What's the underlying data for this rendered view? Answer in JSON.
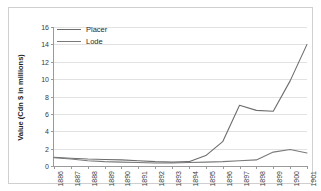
{
  "chart_data": {
    "type": "line",
    "title": "",
    "xlabel": "",
    "ylabel": "Value (Cdn $ in millions)",
    "ylim": [
      0,
      16
    ],
    "ytick_labels": [
      "0",
      "2",
      "4",
      "6",
      "8",
      "10",
      "12",
      "14",
      "16"
    ],
    "ytick_values": [
      0,
      2,
      4,
      6,
      8,
      10,
      12,
      14,
      16
    ],
    "grid": true,
    "legend_position": "top-left",
    "categories": [
      "1886",
      "1887",
      "1888",
      "1889",
      "1890",
      "1891",
      "1892",
      "1893",
      "1894",
      "1895",
      "1896",
      "1897",
      "1898",
      "1899",
      "1900",
      "1901"
    ],
    "series": [
      {
        "name": "Placer",
        "color": "#6d6d6d",
        "values": [
          1.0,
          0.9,
          0.8,
          0.75,
          0.7,
          0.6,
          0.5,
          0.45,
          0.5,
          1.2,
          2.8,
          7.0,
          6.4,
          6.3,
          9.8,
          14.0
        ]
      },
      {
        "name": "Lode",
        "color": "#7a7a7a",
        "values": [
          0.95,
          0.8,
          0.6,
          0.5,
          0.45,
          0.4,
          0.35,
          0.35,
          0.4,
          0.45,
          0.5,
          0.6,
          0.7,
          1.6,
          1.9,
          1.5
        ]
      }
    ]
  },
  "legend": {
    "items": [
      {
        "label": "Placer"
      },
      {
        "label": "Lode"
      }
    ]
  },
  "axis": {
    "y_title": "Value (Cdn $ in millions)"
  }
}
